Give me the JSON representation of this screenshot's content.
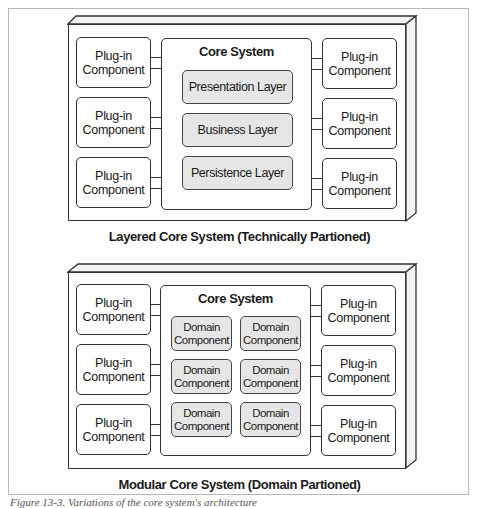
{
  "diagrams": [
    {
      "name": "layered",
      "caption": "Layered Core System (Technically Partioned)",
      "core": {
        "title": "Core System",
        "layers": [
          "Presentation Layer",
          "Business Layer",
          "Persistence Layer"
        ]
      },
      "plugins_left": [
        {
          "line1": "Plug-in",
          "line2": "Component"
        },
        {
          "line1": "Plug-in",
          "line2": "Component"
        },
        {
          "line1": "Plug-in",
          "line2": "Component"
        }
      ],
      "plugins_right": [
        {
          "line1": "Plug-in",
          "line2": "Component"
        },
        {
          "line1": "Plug-in",
          "line2": "Component"
        },
        {
          "line1": "Plug-in",
          "line2": "Component"
        }
      ]
    },
    {
      "name": "modular",
      "caption": "Modular Core System (Domain Partioned)",
      "core": {
        "title": "Core System",
        "domains": [
          {
            "line1": "Domain",
            "line2": "Component"
          },
          {
            "line1": "Domain",
            "line2": "Component"
          },
          {
            "line1": "Domain",
            "line2": "Component"
          },
          {
            "line1": "Domain",
            "line2": "Component"
          },
          {
            "line1": "Domain",
            "line2": "Component"
          },
          {
            "line1": "Domain",
            "line2": "Component"
          }
        ]
      },
      "plugins_left": [
        {
          "line1": "Plug-in",
          "line2": "Component"
        },
        {
          "line1": "Plug-in",
          "line2": "Component"
        },
        {
          "line1": "Plug-in",
          "line2": "Component"
        }
      ],
      "plugins_right": [
        {
          "line1": "Plug-in",
          "line2": "Component"
        },
        {
          "line1": "Plug-in",
          "line2": "Component"
        },
        {
          "line1": "Plug-in",
          "line2": "Component"
        }
      ]
    }
  ],
  "figure_caption": "Figure 13-3. Variations of the core system's architecture",
  "colors": {
    "stroke": "#333333",
    "fill_inner": "#e6e6e6",
    "frame": "#b8b8b8",
    "background": "#ffffff"
  }
}
